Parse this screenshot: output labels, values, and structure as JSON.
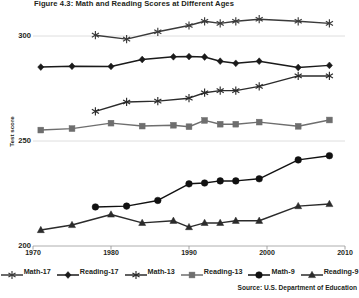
{
  "title": "Figure 4.3: Math and Reading Scores at Different Ages",
  "source": "Source: U.S. Department of Education",
  "axis": {
    "ylabel": "Test score",
    "yticks": [
      "200",
      "250",
      "300"
    ],
    "xticks": [
      "1970",
      "1980",
      "1990",
      "2000",
      "2010"
    ]
  },
  "legend": [
    {
      "label": "Math-17",
      "marker": "asterisk",
      "color": "#3a3a3a"
    },
    {
      "label": "Reading-17",
      "marker": "diamond",
      "color": "#1a1a1a"
    },
    {
      "label": "Math-13",
      "marker": "asterisk",
      "color": "#2b2b2b"
    },
    {
      "label": "Reading-13",
      "marker": "square",
      "color": "#6e6e6e"
    },
    {
      "label": "Math-9",
      "marker": "circle",
      "color": "#111111"
    },
    {
      "label": "Reading-9",
      "marker": "triangle",
      "color": "#2b2b2b"
    }
  ],
  "chart_data": {
    "type": "line",
    "title": "Figure 4.3: Math and Reading Scores at Different Ages",
    "xlabel": "",
    "ylabel": "Test score",
    "xlim": [
      1970,
      2010
    ],
    "ylim": [
      200,
      310
    ],
    "yticks": [
      200,
      250,
      300
    ],
    "xticks": [
      1970,
      1980,
      1990,
      2000,
      2010
    ],
    "grid": true,
    "legend_position": "bottom",
    "note": "NAEP long-term trend scale scores by subject and age",
    "series": [
      {
        "name": "Math-17",
        "marker": "asterisk",
        "color": "#3a3a3a",
        "x": [
          1978,
          1982,
          1986,
          1990,
          1992,
          1994,
          1996,
          1999,
          2004,
          2008
        ],
        "y": [
          300.4,
          298.5,
          302.0,
          305.0,
          307.0,
          306.0,
          307.0,
          308.0,
          307.0,
          306.0
        ]
      },
      {
        "name": "Reading-17",
        "marker": "diamond",
        "color": "#1a1a1a",
        "x": [
          1971,
          1975,
          1980,
          1984,
          1988,
          1990,
          1992,
          1994,
          1996,
          1999,
          2004,
          2008
        ],
        "y": [
          285.2,
          285.6,
          285.5,
          288.8,
          290.1,
          290.2,
          290.0,
          288.0,
          287.0,
          288.0,
          285.0,
          286.0
        ]
      },
      {
        "name": "Math-13",
        "marker": "asterisk",
        "color": "#2b2b2b",
        "x": [
          1978,
          1982,
          1986,
          1990,
          1992,
          1994,
          1996,
          1999,
          2004,
          2008
        ],
        "y": [
          264.1,
          268.6,
          269.0,
          270.4,
          273.0,
          274.0,
          274.0,
          276.0,
          281.0,
          281.0
        ]
      },
      {
        "name": "Reading-13",
        "marker": "square",
        "color": "#6e6e6e",
        "x": [
          1971,
          1975,
          1980,
          1984,
          1988,
          1990,
          1992,
          1994,
          1996,
          1999,
          2004,
          2008
        ],
        "y": [
          255.2,
          255.9,
          258.5,
          257.1,
          257.5,
          256.8,
          259.8,
          258.0,
          258.0,
          259.0,
          257.0,
          260.0
        ]
      },
      {
        "name": "Math-9",
        "marker": "circle",
        "color": "#111111",
        "x": [
          1978,
          1982,
          1986,
          1990,
          1992,
          1994,
          1996,
          1999,
          2004,
          2008
        ],
        "y": [
          218.6,
          219.0,
          221.7,
          229.6,
          230.0,
          231.0,
          231.0,
          232.0,
          241.0,
          243.0
        ]
      },
      {
        "name": "Reading-9",
        "marker": "triangle",
        "color": "#2b2b2b",
        "x": [
          1971,
          1975,
          1980,
          1984,
          1988,
          1990,
          1992,
          1994,
          1996,
          1999,
          2004,
          2008
        ],
        "y": [
          207.6,
          210.0,
          215.0,
          211.0,
          212.0,
          209.0,
          211.0,
          211.0,
          212.0,
          212.0,
          219.0,
          220.0
        ]
      }
    ]
  }
}
